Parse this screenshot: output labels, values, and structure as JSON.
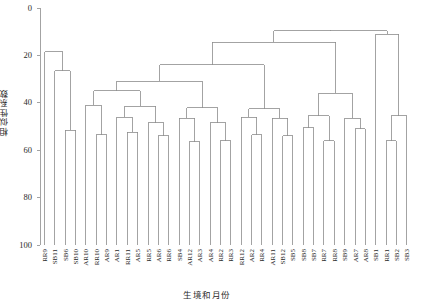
{
  "chart_data": {
    "type": "dendrogram",
    "title": "",
    "subtitle": "",
    "xlabel": "生境和月份",
    "ylabel": "相似性系数",
    "ylim": [
      0,
      100
    ],
    "y_inverted": true,
    "yticks": [
      0,
      20,
      40,
      60,
      80,
      100
    ],
    "ytick_labels": [
      "0",
      "20",
      "40",
      "60",
      "80",
      "100"
    ],
    "grid": false,
    "legend": "none",
    "leaf_count": 36,
    "leaves": [
      "RR9",
      "SB11",
      "SB6",
      "SB10",
      "AR10",
      "RR10",
      "AR9",
      "AR1",
      "RR11",
      "AR5",
      "RR5",
      "AR6",
      "RR6",
      "SB4",
      "AR12",
      "AR3",
      "AR4",
      "RR2",
      "RR3",
      "RR12",
      "AR2",
      "RR4",
      "AR11",
      "SB12",
      "SB5",
      "SB8",
      "SB7",
      "RR7",
      "RR8",
      "SB9",
      "AR7",
      "AR8",
      "SB1",
      "RR1",
      "SB2",
      "SB3"
    ],
    "merges": [
      {
        "id": "m1",
        "left": "SB6",
        "right": "SB10",
        "height": 51.5
      },
      {
        "id": "m2",
        "left": "SB11",
        "right": "m1",
        "height": 26.5
      },
      {
        "id": "m3",
        "left": "RR9",
        "right": "m2",
        "height": 18.5
      },
      {
        "id": "m4",
        "left": "RR10",
        "right": "AR9",
        "height": 53.5
      },
      {
        "id": "m5",
        "left": "AR10",
        "right": "m4",
        "height": 41.0
      },
      {
        "id": "m6",
        "left": "RR11",
        "right": "AR5",
        "height": 52.5
      },
      {
        "id": "m7",
        "left": "AR1",
        "right": "m6",
        "height": 46.0
      },
      {
        "id": "m8",
        "left": "AR6",
        "right": "RR6",
        "height": 54.0
      },
      {
        "id": "m9",
        "left": "RR5",
        "right": "m8",
        "height": 48.5
      },
      {
        "id": "m10",
        "left": "m7",
        "right": "m9",
        "height": 41.5
      },
      {
        "id": "m11",
        "left": "m5",
        "right": "m10",
        "height": 35.0
      },
      {
        "id": "m12",
        "left": "AR12",
        "right": "AR3",
        "height": 56.5
      },
      {
        "id": "m13",
        "left": "SB4",
        "right": "m12",
        "height": 46.5
      },
      {
        "id": "m14",
        "left": "RR2",
        "right": "RR3",
        "height": 56.0
      },
      {
        "id": "m15",
        "left": "AR4",
        "right": "m14",
        "height": 48.5
      },
      {
        "id": "m16",
        "left": "m13",
        "right": "m15",
        "height": 42.0
      },
      {
        "id": "m17",
        "left": "m11",
        "right": "m16",
        "height": 31.0
      },
      {
        "id": "m18",
        "left": "AR2",
        "right": "RR4",
        "height": 53.5
      },
      {
        "id": "m19",
        "left": "RR12",
        "right": "m18",
        "height": 46.0
      },
      {
        "id": "m20",
        "left": "SB12",
        "right": "SB5",
        "height": 54.0
      },
      {
        "id": "m21",
        "left": "AR11",
        "right": "m20",
        "height": 46.5
      },
      {
        "id": "m22",
        "left": "m19",
        "right": "m21",
        "height": 42.5
      },
      {
        "id": "m23",
        "left": "m17",
        "right": "m22",
        "height": 24.0
      },
      {
        "id": "m24",
        "left": "RR7",
        "right": "RR8",
        "height": 56.0
      },
      {
        "id": "m25",
        "left": "SB8",
        "right": "SB7",
        "height": 50.5
      },
      {
        "id": "m26",
        "left": "m25",
        "right": "m24",
        "height": 45.5
      },
      {
        "id": "m27",
        "left": "AR7",
        "right": "AR8",
        "height": 51.0
      },
      {
        "id": "m28",
        "left": "SB9",
        "right": "m27",
        "height": 46.5
      },
      {
        "id": "m29",
        "left": "m26",
        "right": "m28",
        "height": 36.0
      },
      {
        "id": "m30",
        "left": "m23",
        "right": "m29",
        "height": 14.5
      },
      {
        "id": "m31",
        "left": "RR1",
        "right": "SB2",
        "height": 56.0
      },
      {
        "id": "m32",
        "left": "SB3",
        "right": "m31",
        "height": 45.5
      },
      {
        "id": "m33",
        "left": "SB1",
        "right": "m32",
        "height": 11.0
      },
      {
        "id": "m34",
        "left": "m30",
        "right": "m33",
        "height": 9.5
      }
    ]
  },
  "axes": {
    "ylabel": "相似性系数",
    "xlabel": "生境和月份",
    "ytick_labels": [
      "0",
      "20",
      "40",
      "60",
      "80",
      "100"
    ]
  }
}
